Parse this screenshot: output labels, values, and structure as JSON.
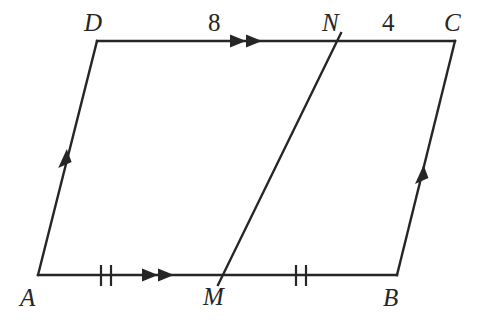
{
  "figure": {
    "type": "geometry-diagram",
    "shape": "parallelogram",
    "background_color": "#ffffff",
    "stroke_color": "#262626",
    "stroke_width": 2.4
  },
  "vertices": [
    {
      "id": "A",
      "label": "A",
      "point": {
        "x": 38,
        "y": 275
      },
      "label_pos": {
        "x": 20,
        "y": 285
      }
    },
    {
      "id": "B",
      "label": "B",
      "point": {
        "x": 397,
        "y": 275
      },
      "label_pos": {
        "x": 383,
        "y": 285
      }
    },
    {
      "id": "C",
      "label": "C",
      "point": {
        "x": 455,
        "y": 41
      },
      "label_pos": {
        "x": 444,
        "y": 10
      }
    },
    {
      "id": "D",
      "label": "D",
      "point": {
        "x": 97,
        "y": 41
      },
      "label_pos": {
        "x": 84,
        "y": 10
      }
    },
    {
      "id": "M",
      "label": "M",
      "point": {
        "x": 223,
        "y": 275
      },
      "label_pos": {
        "x": 203,
        "y": 284
      }
    },
    {
      "id": "N",
      "label": "N",
      "point": {
        "x": 337,
        "y": 41
      },
      "label_pos": {
        "x": 322,
        "y": 10
      }
    }
  ],
  "segments": [
    {
      "id": "AD",
      "from": "A",
      "to": "D",
      "marks": "single-arrow"
    },
    {
      "id": "DC",
      "from": "D",
      "to": "C",
      "marks": "double-arrow-on-DN"
    },
    {
      "id": "BC",
      "from": "B",
      "to": "C",
      "marks": "single-arrow"
    },
    {
      "id": "AB",
      "from": "A",
      "to": "B",
      "marks": "double-arrow-and-ticks"
    },
    {
      "id": "MN",
      "from": "M",
      "to": "N",
      "marks": "none"
    }
  ],
  "measures": [
    {
      "id": "DN",
      "label": "8",
      "pos": {
        "x": 208,
        "y": 10
      },
      "segment": "DN"
    },
    {
      "id": "NC",
      "label": "4",
      "pos": {
        "x": 382,
        "y": 10
      },
      "segment": "NC"
    }
  ],
  "tick_marks": [
    {
      "id": "AM-ticks",
      "count": 2,
      "on_segment": "AM",
      "center": {
        "x": 106,
        "y": 275
      }
    },
    {
      "id": "MB-ticks",
      "count": 2,
      "on_segment": "MB",
      "center": {
        "x": 301,
        "y": 275
      }
    }
  ],
  "arrow_marks": [
    {
      "id": "AD-arrow",
      "count": 1,
      "on_segment": "AD"
    },
    {
      "id": "BC-arrow",
      "count": 1,
      "on_segment": "BC"
    },
    {
      "id": "DN-arrows",
      "count": 2,
      "on_segment": "DC"
    },
    {
      "id": "AM-arrows",
      "count": 2,
      "on_segment": "AB"
    }
  ]
}
